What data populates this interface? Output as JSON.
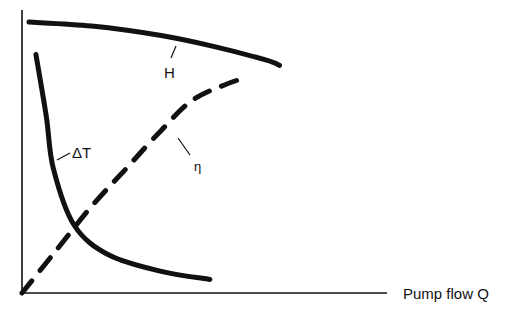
{
  "chart_data": {
    "type": "line",
    "title": "",
    "xlabel": "Pump flow Q",
    "ylabel": "",
    "xlim": [
      0,
      10
    ],
    "ylim": [
      0,
      10
    ],
    "grid": false,
    "legend": "none (curves labelled inline)",
    "series": [
      {
        "name": "H",
        "style": "solid",
        "x": [
          0.2,
          2.0,
          4.0,
          5.5,
          7.0,
          7.4
        ],
        "y": [
          10.0,
          9.85,
          9.5,
          9.1,
          8.6,
          8.4
        ]
      },
      {
        "name": "ΔT",
        "style": "solid",
        "x": [
          0.4,
          0.7,
          0.9,
          1.5,
          2.5,
          4.0,
          5.4
        ],
        "y": [
          8.8,
          6.5,
          4.6,
          2.5,
          1.4,
          0.8,
          0.5
        ]
      },
      {
        "name": "η",
        "style": "dashed",
        "x": [
          0.0,
          1.0,
          2.0,
          3.0,
          4.0,
          5.0,
          6.5
        ],
        "y": [
          0.0,
          1.6,
          3.2,
          4.6,
          6.0,
          7.2,
          8.0
        ]
      }
    ],
    "annotations": [
      "H",
      "ΔT",
      "η"
    ]
  }
}
